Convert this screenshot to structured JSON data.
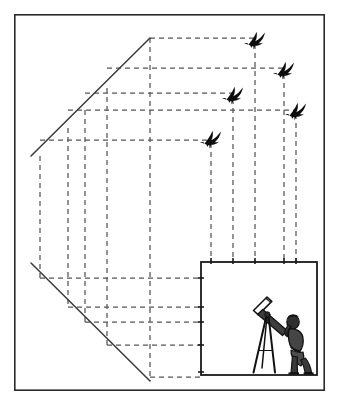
{
  "figure": {
    "caption": "",
    "background_color": "#ffffff",
    "ink_color": "#1a1a1a",
    "dash_color": "#555555"
  },
  "frame": {
    "name": "outer-border",
    "x": 14,
    "y": 14,
    "width": 311,
    "height": 377,
    "stroke": "#2b2b2b",
    "stroke_width": 1.6
  },
  "projection_plane": {
    "name": "image-plane-box",
    "x": 201,
    "y": 262,
    "width": 116,
    "height": 113,
    "stroke": "#1a1a1a",
    "stroke_width": 1.8,
    "fill": "#ffffff"
  },
  "sight_lines": [
    {
      "name": "upper-sight-line",
      "x1": 31,
      "y1": 156,
      "x2": 150,
      "y2": 38,
      "stroke": "#3a3a3a",
      "stroke_width": 1.5
    },
    {
      "name": "lower-sight-line",
      "x1": 31,
      "y1": 263,
      "x2": 150,
      "y2": 381,
      "stroke": "#3a3a3a",
      "stroke_width": 1.5
    }
  ],
  "vertical_guides": [
    {
      "name": "guide-v1",
      "x": 40,
      "y1": 156,
      "y2": 278
    },
    {
      "name": "guide-v2",
      "x": 68,
      "y1": 128,
      "y2": 307
    },
    {
      "name": "guide-v3",
      "x": 85,
      "y1": 110,
      "y2": 322
    },
    {
      "name": "guide-v4",
      "x": 107,
      "y1": 88,
      "y2": 345
    },
    {
      "name": "guide-v5",
      "x": 150,
      "y1": 38,
      "y2": 381
    }
  ],
  "bird_drop_lines": [
    {
      "name": "drop-line-bird-5",
      "x": 211,
      "y1": 143,
      "y2": 262
    },
    {
      "name": "drop-line-bird-3",
      "x": 233,
      "y1": 99,
      "y2": 262
    },
    {
      "name": "drop-line-bird-1",
      "x": 255,
      "y1": 44,
      "y2": 262
    },
    {
      "name": "drop-line-bird-2",
      "x": 284,
      "y1": 74,
      "y2": 262
    },
    {
      "name": "drop-line-bird-4",
      "x": 296,
      "y1": 114,
      "y2": 262
    }
  ],
  "horizontal_guides_upper": [
    {
      "name": "guide-h-top-1",
      "y": 38,
      "x1": 150,
      "x2": 255
    },
    {
      "name": "guide-h-top-2",
      "y": 68,
      "x1": 107,
      "x2": 284
    },
    {
      "name": "guide-h-top-3",
      "y": 93,
      "x1": 85,
      "x2": 233
    },
    {
      "name": "guide-h-top-4",
      "y": 110,
      "x1": 68,
      "x2": 296
    },
    {
      "name": "guide-h-top-5",
      "y": 140,
      "x1": 40,
      "x2": 211
    }
  ],
  "horizontal_guides_lower": [
    {
      "name": "guide-h-bottom-1",
      "y": 278,
      "x1": 40,
      "x2": 201
    },
    {
      "name": "guide-h-bottom-2",
      "y": 307,
      "x1": 68,
      "x2": 201
    },
    {
      "name": "guide-h-bottom-3",
      "y": 322,
      "x1": 85,
      "x2": 201
    },
    {
      "name": "guide-h-bottom-4",
      "y": 345,
      "x1": 107,
      "x2": 201
    },
    {
      "name": "guide-h-bottom-5",
      "y": 377,
      "x1": 150,
      "x2": 201
    }
  ],
  "birds": [
    {
      "name": "bird-1",
      "label": "bird-silhouette-1",
      "x": 255,
      "y": 38,
      "scale": 1.0
    },
    {
      "name": "bird-2",
      "label": "bird-silhouette-2",
      "x": 284,
      "y": 68,
      "scale": 1.0
    },
    {
      "name": "bird-3",
      "label": "bird-silhouette-3",
      "x": 233,
      "y": 93,
      "scale": 1.0
    },
    {
      "name": "bird-4",
      "label": "bird-silhouette-4",
      "x": 296,
      "y": 109,
      "scale": 1.0
    },
    {
      "name": "bird-5",
      "label": "bird-silhouette-5",
      "x": 211,
      "y": 137,
      "scale": 1.0
    }
  ],
  "observer": {
    "name": "astronomer-with-telescope",
    "description": "Person looking through a telescope mounted on a tripod",
    "x": 256,
    "y": 300,
    "width": 62,
    "height": 76
  },
  "tick_marks": {
    "name": "plane-edge-ticks",
    "top_xs": [
      211,
      233,
      255,
      284,
      296
    ],
    "left_ys": [
      278,
      307,
      322,
      345,
      372
    ],
    "length": 5
  },
  "accessibility": {
    "alt_text": "Technical diagram: five flying birds are projected by dashed construction lines down onto a square image plane where an observer uses a telescope. Two solid diagonal sight lines fan out to the left, crossed by a dashed perspective grid."
  }
}
